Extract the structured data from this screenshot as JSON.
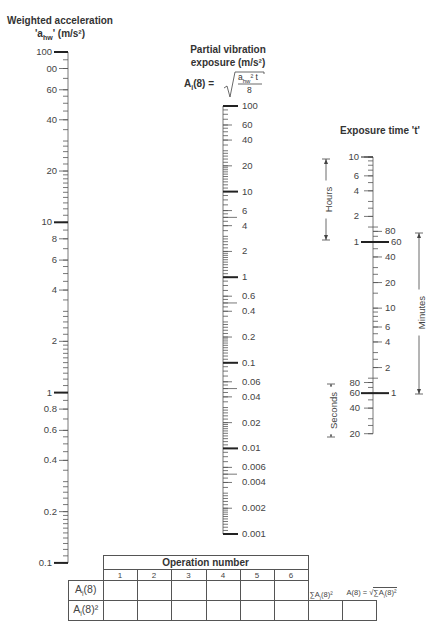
{
  "scales": {
    "acceleration": {
      "title_line1": "Weighted acceleration",
      "title_line2_prefix": "'a",
      "title_line2_sub": "hw",
      "title_line2_suffix": "' (m/s²)",
      "labels": [
        "100",
        "00",
        "60",
        "40",
        "20",
        "10",
        "8",
        "6",
        "4",
        "2",
        "1",
        "0.8",
        "0.6",
        "0.4",
        "0.2",
        "0.1"
      ]
    },
    "partial_exposure": {
      "title_line1": "Partial vibration",
      "title_line2": "exposure (m/s²)",
      "formula_lhs": "A",
      "formula_lhs_sub": "i",
      "formula_lhs_rest": "(8) =",
      "formula_num": "a",
      "formula_num_sub": "hw",
      "formula_num_rest": "² t",
      "formula_den": "8",
      "labels": [
        "100",
        "60",
        "40",
        "20",
        "10",
        "6",
        "4",
        "2",
        "1",
        "0.6",
        "0.4",
        "0.2",
        "0.1",
        "0.06",
        "0.04",
        "0.02",
        "0.01",
        "0.006",
        "0.004",
        "0.002",
        "0.001"
      ]
    },
    "exposure_time": {
      "title": "Exposure time 't'",
      "hours_label": "Hours",
      "minutes_label": "Minutes",
      "seconds_label": "Seconds",
      "hours_labels": [
        "10",
        "6",
        "4",
        "2",
        "1"
      ],
      "minutes_labels": [
        "80",
        "60",
        "40",
        "20",
        "10",
        "6",
        "4",
        "2",
        "1"
      ],
      "seconds_labels": [
        "80",
        "60",
        "40",
        "20"
      ]
    }
  },
  "table": {
    "header": "Operation number",
    "columns": [
      "1",
      "2",
      "3",
      "4",
      "5",
      "6"
    ],
    "row1_label": "A",
    "row1_sub": "i",
    "row1_rest": "(8)",
    "row2_label": "A",
    "row2_sub": "i",
    "row2_rest": "(8)²",
    "sum_label": "∑A",
    "sum_sub": "i",
    "sum_rest": "(8)²",
    "total_label": "A(8) = ",
    "total_root": "∑A",
    "total_root_sub": "i",
    "total_root_rest": "(8)²"
  }
}
